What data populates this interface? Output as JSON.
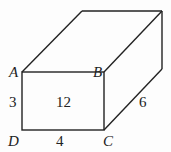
{
  "diagram": {
    "type": "rectangular-prism",
    "vertices": {
      "A": "A",
      "B": "B",
      "C": "C",
      "D": "D"
    },
    "labels": {
      "AD": "3",
      "DC": "4",
      "BC_depth": "6",
      "face_area": "12"
    },
    "stroke_color": "#222222"
  }
}
